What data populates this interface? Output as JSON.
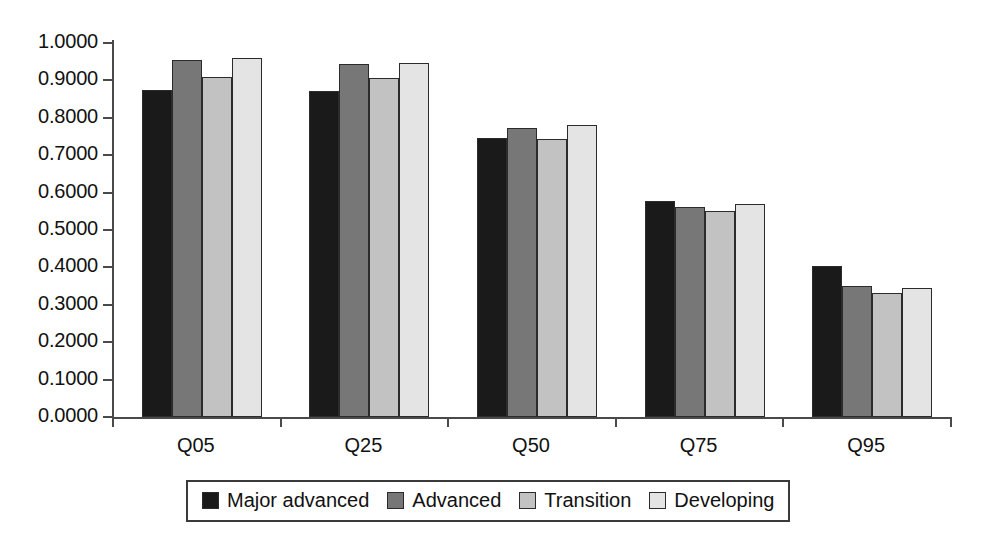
{
  "chart_data": {
    "type": "bar",
    "title": "",
    "subtitle": "",
    "xlabel": "",
    "ylabel": "",
    "categories": [
      "Q05",
      "Q25",
      "Q50",
      "Q75",
      "Q95"
    ],
    "series": [
      {
        "name": "Major advanced",
        "color": "#1a1a1a",
        "values": [
          0.874,
          0.872,
          0.745,
          0.578,
          0.404
        ]
      },
      {
        "name": "Advanced",
        "color": "#777777",
        "values": [
          0.954,
          0.944,
          0.774,
          0.562,
          0.349
        ]
      },
      {
        "name": "Transition",
        "color": "#c2c2c2",
        "values": [
          0.909,
          0.906,
          0.743,
          0.551,
          0.331
        ]
      },
      {
        "name": "Developing",
        "color": "#e4e4e4",
        "values": [
          0.96,
          0.946,
          0.782,
          0.57,
          0.346
        ]
      }
    ],
    "ylim": [
      0.0,
      1.0
    ],
    "ytick_values": [
      0.0,
      0.1,
      0.2,
      0.3,
      0.4,
      0.5,
      0.6,
      0.7,
      0.8,
      0.9,
      1.0
    ],
    "ytick_labels": [
      "0.0000",
      "0.1000",
      "0.2000",
      "0.3000",
      "0.4000",
      "0.5000",
      "0.6000",
      "0.7000",
      "0.8000",
      "0.9000",
      "1.0000"
    ],
    "grid": false,
    "legend_position": "bottom"
  },
  "legend": {
    "items": [
      {
        "label": "Major advanced",
        "color": "#1a1a1a"
      },
      {
        "label": "Advanced",
        "color": "#777777"
      },
      {
        "label": "Transition",
        "color": "#c2c2c2"
      },
      {
        "label": "Developing",
        "color": "#e4e4e4"
      }
    ]
  }
}
